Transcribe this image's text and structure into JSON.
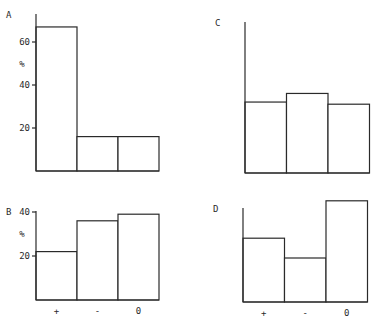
{
  "chart_data": [
    {
      "type": "bar",
      "panel": "A",
      "categories": [
        "+",
        "-",
        "0"
      ],
      "values": [
        67,
        16,
        16
      ],
      "ylabel": "%",
      "yticks": [
        20,
        40,
        60
      ],
      "ylim": [
        0,
        70
      ],
      "show_category_labels": false,
      "frame": {
        "x0": 36,
        "baseline": 171,
        "bar_w": 41,
        "px_per_unit": 2.15,
        "axis_top": 14
      }
    },
    {
      "type": "bar",
      "panel": "B",
      "categories": [
        "+",
        "-",
        "0"
      ],
      "values": [
        22,
        36,
        39
      ],
      "ylabel": "%",
      "yticks": [
        20,
        40
      ],
      "ylim": [
        0,
        40
      ],
      "show_category_labels": true,
      "frame": {
        "x0": 36,
        "baseline": 300,
        "bar_w": 41,
        "px_per_unit": 2.2,
        "axis_top": 211
      }
    },
    {
      "type": "bar",
      "panel": "C",
      "categories": [
        "+",
        "-",
        "0"
      ],
      "values": [
        33,
        37,
        32
      ],
      "ylabel": "",
      "yticks": [],
      "ylim": [
        0,
        70
      ],
      "show_category_labels": false,
      "frame": {
        "x0": 245,
        "baseline": 173,
        "bar_w": 41.5,
        "px_per_unit": 2.15,
        "axis_top": 22
      }
    },
    {
      "type": "bar",
      "panel": "D",
      "categories": [
        "+",
        "-",
        "0"
      ],
      "values": [
        29,
        20,
        46
      ],
      "ylabel": "",
      "yticks": [],
      "ylim": [
        0,
        47
      ],
      "show_category_labels": true,
      "frame": {
        "x0": 243,
        "baseline": 302,
        "bar_w": 41.5,
        "px_per_unit": 2.2,
        "axis_top": 208
      }
    }
  ]
}
